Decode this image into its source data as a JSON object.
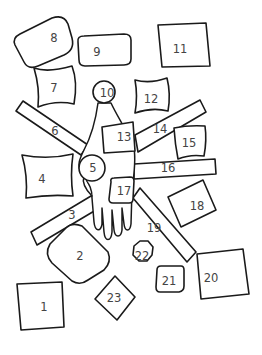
{
  "diagram": {
    "title": "",
    "colors": {
      "stroke": "#1a1a1a",
      "label": "#444444",
      "background": "#ffffff"
    },
    "center_figure": "hand",
    "pieces": [
      {
        "id": 1,
        "label": "1",
        "shape": "square"
      },
      {
        "id": 2,
        "label": "2",
        "shape": "rounded-diamond"
      },
      {
        "id": 3,
        "label": "3",
        "shape": "bar"
      },
      {
        "id": 4,
        "label": "4",
        "shape": "pinched-rectangle"
      },
      {
        "id": 5,
        "label": "5",
        "shape": "circle"
      },
      {
        "id": 6,
        "label": "6",
        "shape": "bar"
      },
      {
        "id": 7,
        "label": "7",
        "shape": "pinched-square"
      },
      {
        "id": 8,
        "label": "8",
        "shape": "rounded-rectangle"
      },
      {
        "id": 9,
        "label": "9",
        "shape": "rounded-rectangle"
      },
      {
        "id": 10,
        "label": "10",
        "shape": "circle"
      },
      {
        "id": 11,
        "label": "11",
        "shape": "square"
      },
      {
        "id": 12,
        "label": "12",
        "shape": "pinched-square"
      },
      {
        "id": 13,
        "label": "13",
        "shape": "rectangle"
      },
      {
        "id": 14,
        "label": "14",
        "shape": "bar"
      },
      {
        "id": 15,
        "label": "15",
        "shape": "pinched-square"
      },
      {
        "id": 16,
        "label": "16",
        "shape": "bar"
      },
      {
        "id": 17,
        "label": "17",
        "shape": "rounded-square"
      },
      {
        "id": 18,
        "label": "18",
        "shape": "tilted-square"
      },
      {
        "id": 19,
        "label": "19",
        "shape": "bar"
      },
      {
        "id": 20,
        "label": "20",
        "shape": "square"
      },
      {
        "id": 21,
        "label": "21",
        "shape": "rounded-square"
      },
      {
        "id": 22,
        "label": "22",
        "shape": "octagon"
      },
      {
        "id": 23,
        "label": "23",
        "shape": "diamond"
      }
    ]
  }
}
